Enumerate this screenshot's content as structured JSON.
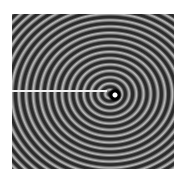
{
  "figure": {
    "colors": {
      "dark": "#2a2a2a",
      "light": "#bdbdbd",
      "line": "#f4f4f4",
      "center": "#ffffff"
    }
  }
}
